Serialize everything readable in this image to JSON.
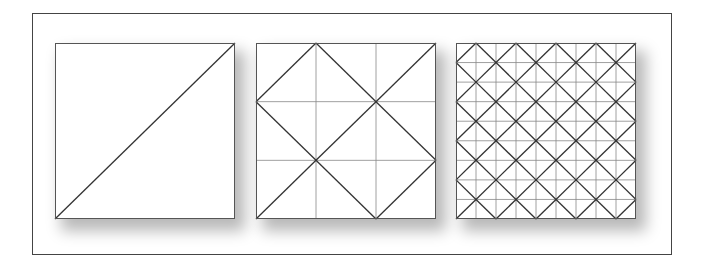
{
  "figure": {
    "colors": {
      "frame_border": "#444444",
      "grid_line": "#888888",
      "diagonal_line": "#333333",
      "background": "#ffffff"
    },
    "panels": [
      {
        "id": "panel-1",
        "grid_divisions": 1,
        "diagonal_rule": "single-diagonal",
        "left": 55
      },
      {
        "id": "panel-2",
        "grid_divisions": 3,
        "diagonal_rule": "odd-lines",
        "left": 256
      },
      {
        "id": "panel-3",
        "grid_divisions": 9,
        "diagonal_rule": "odd-lines",
        "left": 456
      }
    ]
  }
}
